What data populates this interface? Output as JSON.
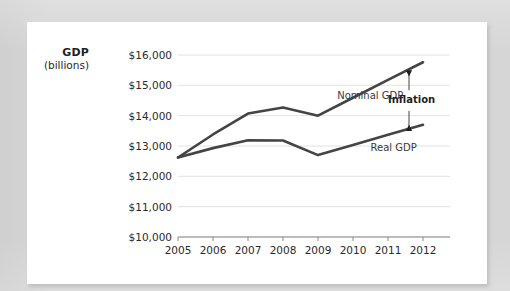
{
  "figure": {
    "background_color": "#d6d6d6",
    "card_color": "#ffffff",
    "line_color": "#444444",
    "grid_color": "#e2e2e2",
    "axis_color": "#8a8a8a"
  },
  "axis_title": {
    "line1": "GDP",
    "line2": "(billions)"
  },
  "chart_data": {
    "type": "line",
    "title": "",
    "subtitle": "",
    "xlabel": "",
    "ylabel": "GDP (billions)",
    "categories": [
      "2005",
      "2006",
      "2007",
      "2008",
      "2009",
      "2010",
      "2011",
      "2012"
    ],
    "x": [
      2005,
      2006,
      2007,
      2008,
      2009,
      2010,
      2011,
      2012
    ],
    "ylim": [
      10000,
      16000
    ],
    "ytick_values": [
      10000,
      11000,
      12000,
      13000,
      14000,
      15000,
      16000
    ],
    "ytick_labels": [
      "$10,000",
      "$11,000",
      "$12,000",
      "$13,000",
      "$14,000",
      "$15,000",
      "$16,000"
    ],
    "xtick_labels": [
      "2005",
      "2006",
      "2007",
      "2008",
      "2009",
      "2010",
      "2011",
      "2012"
    ],
    "grid": true,
    "grid_axis": "y",
    "legend": "inline-labels",
    "legend_position": "right-of-lines",
    "series": [
      {
        "name": "Nominal GDP",
        "color": "#444444",
        "values": [
          12620,
          13380,
          14070,
          14270,
          14000,
          14590,
          15180,
          15760
        ]
      },
      {
        "name": "Real GDP",
        "color": "#444444",
        "values": [
          12620,
          12930,
          13190,
          13180,
          12700,
          13030,
          13370,
          13700
        ]
      }
    ],
    "annotations": [
      {
        "name": "inflation-gap",
        "label": "Inflation",
        "type": "double-arrow",
        "at_x": 2011.6,
        "from_value": 13560,
        "to_value": 15430
      }
    ]
  }
}
